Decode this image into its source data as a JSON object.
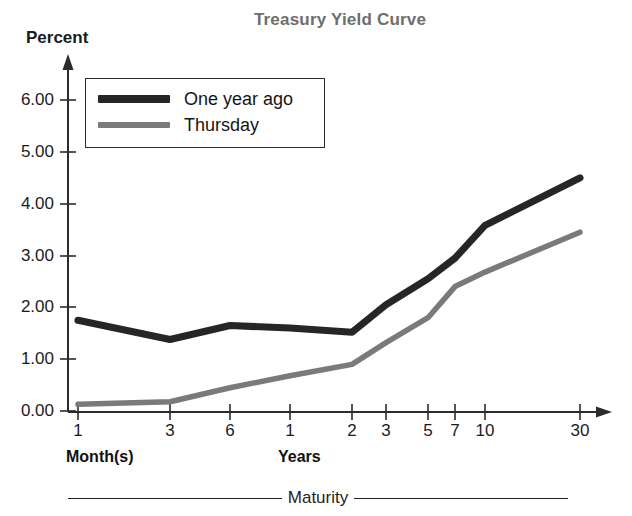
{
  "chart_data": {
    "type": "line",
    "title": "Treasury Yield Curve",
    "ylabel": "Percent",
    "xlabel": "Maturity",
    "x": [
      "1",
      "3",
      "6",
      "1",
      "2",
      "3",
      "5",
      "7",
      "10",
      "30"
    ],
    "x_group_labels": [
      "Month(s)",
      "Years"
    ],
    "x_tick_labels": [
      "1",
      "3",
      "6",
      "1",
      "2",
      "3",
      "5",
      "7",
      "10",
      "30"
    ],
    "y_tick_labels": [
      "0.00",
      "1.00",
      "2.00",
      "3.00",
      "4.00",
      "5.00",
      "6.00"
    ],
    "ylim": [
      0,
      6.6
    ],
    "grid": false,
    "legend_position": "upper-left",
    "series": [
      {
        "name": "One year ago",
        "color": "#262626",
        "values": [
          1.75,
          1.38,
          1.65,
          1.6,
          1.52,
          2.05,
          2.55,
          2.95,
          3.58,
          4.5
        ]
      },
      {
        "name": "Thursday",
        "color": "#7a7a7a",
        "values": [
          0.13,
          0.18,
          0.45,
          0.68,
          0.9,
          1.32,
          1.8,
          2.4,
          2.68,
          3.45
        ]
      }
    ]
  },
  "title": {
    "text": "Treasury Yield Curve",
    "color": "#6e6e6e"
  },
  "axes": {
    "y_title": "Percent",
    "y_ticks": [
      {
        "label": "6.00",
        "top": 90
      },
      {
        "label": "5.00",
        "top": 142
      },
      {
        "label": "4.00",
        "top": 194
      },
      {
        "label": "3.00",
        "top": 246
      },
      {
        "label": "2.00",
        "top": 297
      },
      {
        "label": "1.00",
        "top": 349
      },
      {
        "label": "0.00",
        "top": 401
      }
    ],
    "x_ticks": [
      {
        "label": "1",
        "left": 58
      },
      {
        "label": "3",
        "left": 150
      },
      {
        "label": "6",
        "left": 210
      },
      {
        "label": "1",
        "left": 270
      },
      {
        "label": "2",
        "left": 332
      },
      {
        "label": "3",
        "left": 366
      },
      {
        "label": "5",
        "left": 408
      },
      {
        "label": "7",
        "left": 435
      },
      {
        "label": "10",
        "left": 465
      },
      {
        "label": "30",
        "left": 560
      }
    ],
    "group_labels": [
      {
        "text": "Month(s)",
        "left": 66
      },
      {
        "text": "Years",
        "left": 278
      }
    ]
  },
  "legend": {
    "entries": [
      {
        "label": "One year ago",
        "color": "#262626",
        "thickness": 8
      },
      {
        "label": "Thursday",
        "color": "#7a7a7a",
        "thickness": 6
      }
    ]
  },
  "caption": {
    "text": "Maturity"
  }
}
